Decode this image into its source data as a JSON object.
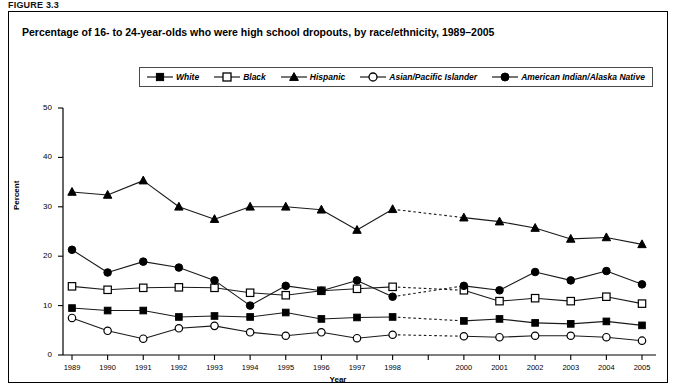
{
  "figure": {
    "label": "FIGURE 3.3",
    "title": "Percentage of 16- to 24-year-olds who were high school dropouts, by race/ethnicity, 1989–2005"
  },
  "chart_data": {
    "type": "line",
    "title": "Percentage of 16- to 24-year-olds who were high school dropouts, by race/ethnicity, 1989–2005",
    "xlabel": "Year",
    "ylabel": "Percent",
    "ylim": [
      0,
      50
    ],
    "ytick_values": [
      0,
      10,
      20,
      30,
      40,
      50
    ],
    "ytick_labels": [
      "0",
      "10",
      "20",
      "30",
      "40",
      "50"
    ],
    "grid": false,
    "legend_position": "top-center",
    "gap_note": "No data point plotted for 1999; segments spanning 1998–2000 are drawn dotted.",
    "categories": [
      1989,
      1990,
      1991,
      1992,
      1993,
      1994,
      1995,
      1996,
      1997,
      1998,
      1999,
      2000,
      2001,
      2002,
      2003,
      2004,
      2005
    ],
    "x": [
      "1989",
      "1990",
      "1991",
      "1992",
      "1993",
      "1994",
      "1995",
      "1996",
      "1997",
      "1998",
      "",
      "2000",
      "2001",
      "2002",
      "2003",
      "2004",
      "2005"
    ],
    "series": [
      {
        "name": "White",
        "marker": "filled-square",
        "values": [
          9.5,
          9.0,
          9.0,
          7.7,
          7.9,
          7.7,
          8.6,
          7.3,
          7.6,
          7.7,
          null,
          6.9,
          7.3,
          6.5,
          6.3,
          6.8,
          6.0
        ]
      },
      {
        "name": "Black",
        "marker": "open-square",
        "values": [
          13.9,
          13.2,
          13.6,
          13.7,
          13.6,
          12.6,
          12.1,
          13.0,
          13.4,
          13.8,
          null,
          13.1,
          10.9,
          11.5,
          10.9,
          11.8,
          10.4
        ]
      },
      {
        "name": "Hispanic",
        "marker": "filled-triangle",
        "values": [
          33.0,
          32.4,
          35.3,
          30.0,
          27.5,
          30.0,
          30.0,
          29.4,
          25.3,
          29.5,
          null,
          27.8,
          27.0,
          25.7,
          23.5,
          23.8,
          22.4
        ]
      },
      {
        "name": "Asian/Pacific Islander",
        "marker": "open-circle",
        "values": [
          7.5,
          4.9,
          3.3,
          5.4,
          5.9,
          4.6,
          3.9,
          4.6,
          3.4,
          4.1,
          null,
          3.8,
          3.6,
          3.9,
          3.9,
          3.6,
          2.9
        ]
      },
      {
        "name": "American Indian/Alaska Native",
        "marker": "filled-circle",
        "values": [
          21.3,
          16.7,
          18.9,
          17.7,
          15.1,
          10.0,
          14.0,
          13.0,
          15.1,
          11.8,
          null,
          14.0,
          13.1,
          16.8,
          15.1,
          17.0,
          14.3
        ]
      }
    ]
  },
  "legend": {
    "items": [
      {
        "label": "White",
        "marker": "filled-square"
      },
      {
        "label": "Black",
        "marker": "open-square"
      },
      {
        "label": "Hispanic",
        "marker": "filled-triangle"
      },
      {
        "label": "Asian/Pacific Islander",
        "marker": "open-circle"
      },
      {
        "label": "American Indian/Alaska Native",
        "marker": "filled-circle"
      }
    ]
  },
  "colors": {
    "line": "#1a1a1a",
    "marker_fill": "#000000",
    "marker_open": "#ffffff",
    "frame": "#000000",
    "background": "#ffffff"
  }
}
